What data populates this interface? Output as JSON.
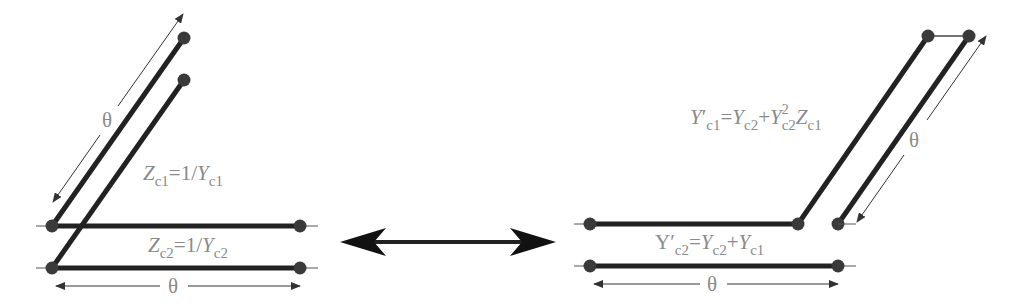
{
  "figure": {
    "left_circuit": {
      "label_upper_line": {
        "lhs": "Z",
        "lhs_sub": "c1",
        "eq": "=1/",
        "rhs": "Y",
        "rhs_sub": "c1"
      },
      "label_lower_line": {
        "lhs": "Z",
        "lhs_sub": "c2",
        "eq": "=1/",
        "rhs": "Y",
        "rhs_sub": "c2"
      },
      "diagonal_length_label": "θ",
      "horizontal_length_label": "θ"
    },
    "right_circuit": {
      "label_stub": {
        "lhs": "Y",
        "prime": "′",
        "lhs_sub": "c1",
        "eq": "=",
        "t1": "Y",
        "t1_sub": "c2",
        "plus": "+",
        "t2": "Y",
        "t2_sup": "2",
        "t2_sub": "c2",
        "t3": "Z",
        "t3_sub": "c1"
      },
      "label_line": {
        "lhs": "Y",
        "prime": "′",
        "lhs_sub": "c2",
        "eq": "=",
        "t1": "Y",
        "t1_sub": "c2",
        "plus": "+",
        "t2": "Y",
        "t2_sub": "c1"
      },
      "diagonal_length_label": "θ",
      "horizontal_length_label": "θ"
    },
    "equivalence_arrow": "double-headed-arrow",
    "colors": {
      "line": "#222222",
      "node": "#3a3a3a",
      "text": "#8a8a8a",
      "thin": "#555555"
    }
  }
}
